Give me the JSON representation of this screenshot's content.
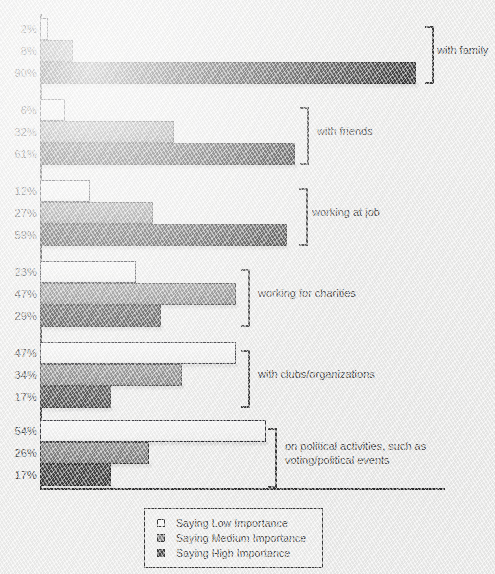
{
  "chart_data": {
    "type": "bar",
    "orientation": "horizontal",
    "title": "",
    "xlabel": "",
    "ylabel": "",
    "xlim": [
      0,
      100
    ],
    "grid": false,
    "legend_position": "bottom",
    "categories": [
      "with family",
      "with friends",
      "working at job",
      "working for charities",
      "with clubs/organizations",
      "on political activities, such as\nvoting/political events"
    ],
    "series": [
      {
        "name": "Saying Low Importance",
        "key": "low",
        "color": "#fbfbfb",
        "values": [
          2,
          6,
          12,
          23,
          47,
          54
        ]
      },
      {
        "name": "Saying Medium Importance",
        "key": "medium",
        "color": "#8a8a8a",
        "values": [
          8,
          32,
          27,
          47,
          34,
          26
        ]
      },
      {
        "name": "Saying High Importance",
        "key": "high",
        "color": "#474747",
        "values": [
          90,
          61,
          59,
          29,
          17,
          17
        ]
      }
    ],
    "value_labels": [
      [
        "2%",
        "8%",
        "90%"
      ],
      [
        "6%",
        "32%",
        "61%"
      ],
      [
        "12%",
        "27%",
        "59%"
      ],
      [
        "23%",
        "47%",
        "29%"
      ],
      [
        "47%",
        "34%",
        "17%"
      ],
      [
        "54%",
        "26%",
        "17%"
      ]
    ]
  },
  "legend": {
    "items": [
      {
        "label": "Saying Low Importance",
        "swatch": "low"
      },
      {
        "label": "Saying Medium Importance",
        "swatch": "medium"
      },
      {
        "label": "Saying High Importance",
        "swatch": "high"
      }
    ]
  },
  "groups": [
    {
      "label": "with family",
      "bracket_x": 425,
      "label_x": 437,
      "top": 18,
      "height": 66
    },
    {
      "label": "with friends",
      "bracket_x": 300,
      "label_x": 317,
      "top": 99,
      "height": 66
    },
    {
      "label": "working at job",
      "bracket_x": 299,
      "label_x": 312,
      "top": 180,
      "height": 66
    },
    {
      "label": "working for charities",
      "bracket_x": 241,
      "label_x": 258,
      "top": 261,
      "height": 66
    },
    {
      "label": "with clubs/organizations",
      "bracket_x": 241,
      "label_x": 258,
      "top": 342,
      "height": 66
    },
    {
      "label": "on political activities, such as\nvoting/political events",
      "bracket_x": 268,
      "label_x": 285,
      "top": 420,
      "height": 68
    }
  ],
  "axis": {
    "origin_x": 40,
    "baseline_y": 488,
    "px_per_percent": 4.18,
    "bar_height": 22,
    "group_pitch": 81
  }
}
